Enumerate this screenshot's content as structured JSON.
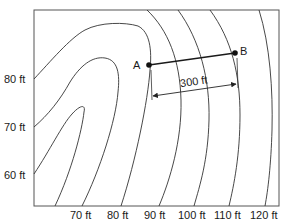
{
  "diagram": {
    "type": "topographic-contour-map",
    "y_axis_labels": [
      {
        "text": "80 ft",
        "y": 79
      },
      {
        "text": "70 ft",
        "y": 127
      },
      {
        "text": "60 ft",
        "y": 175
      }
    ],
    "x_axis_labels": [
      {
        "text": "70 ft",
        "x": 82
      },
      {
        "text": "80 ft",
        "x": 118
      },
      {
        "text": "90 ft",
        "x": 155
      },
      {
        "text": "100 ft",
        "x": 190
      },
      {
        "text": "110 ft",
        "x": 226
      },
      {
        "text": "120 ft",
        "x": 262
      }
    ],
    "points": [
      {
        "label": "A",
        "x": 149,
        "y": 65
      },
      {
        "label": "B",
        "x": 235,
        "y": 53
      }
    ],
    "dimension": {
      "label": "300 ft",
      "from": "A",
      "to": "B"
    },
    "colors": {
      "line": "#333333",
      "frame": "#555555",
      "text": "#1a1a1a"
    }
  }
}
